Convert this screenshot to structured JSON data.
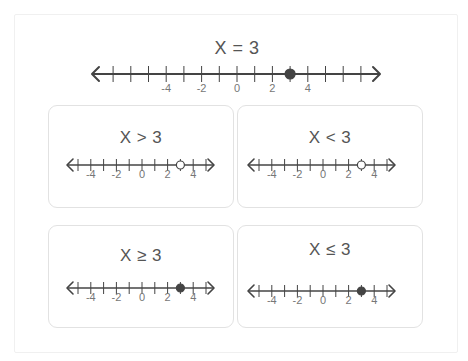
{
  "main": {
    "title": "X = 3",
    "ticks": {
      "min": -7,
      "max": 7
    },
    "labels": [
      "-4",
      "-2",
      "0",
      "2",
      "4"
    ],
    "point": {
      "value": 3,
      "type": "closed"
    }
  },
  "cards": [
    {
      "title": "X > 3",
      "point": {
        "value": 3,
        "type": "open"
      },
      "labels": [
        "-4",
        "-2",
        "0",
        "2",
        "4"
      ]
    },
    {
      "title": "X < 3",
      "point": {
        "value": 3,
        "type": "open"
      },
      "labels": [
        "-4",
        "-2",
        "0",
        "2",
        "4"
      ]
    },
    {
      "title": "X ≥ 3",
      "point": {
        "value": 3,
        "type": "closed"
      },
      "labels": [
        "-4",
        "-2",
        "0",
        "2",
        "4"
      ]
    },
    {
      "title": "X ≤ 3",
      "point": {
        "value": 3,
        "type": "closed"
      },
      "labels": [
        "-4",
        "-2",
        "0",
        "2",
        "4"
      ]
    }
  ],
  "colors": {
    "line": "#444444",
    "point": "#444444",
    "text": "#555555",
    "card_border": "#e2e2e2"
  }
}
